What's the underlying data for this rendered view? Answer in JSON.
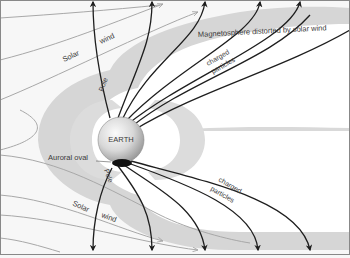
{
  "figure": {
    "labels": {
      "magnetosphere": "Magnetosphere distorted by solar wind",
      "earth": "EARTH",
      "auroral_oval": "Auroral oval",
      "pole_north": "Pole",
      "pole_south": "Pole",
      "solar_top": "Solar",
      "wind_top": "wind",
      "solar_bottom": "Solar",
      "wind_bottom": "wind",
      "charged_top": "charged",
      "particles_top": "particles",
      "charged_bottom": "charged",
      "particles_bottom": "particles"
    },
    "colors": {
      "background": "#f7f7f7",
      "magnetosphere_band": "#d6d6d6",
      "inner_white": "#ffffff",
      "field_line": "#1e1e1e",
      "solar_wind_line": "#a8a8a8",
      "earth_light": "#f2f2f2",
      "earth_dark": "#9a9a9a",
      "auroral_oval": "#111111",
      "border": "#888888"
    }
  }
}
